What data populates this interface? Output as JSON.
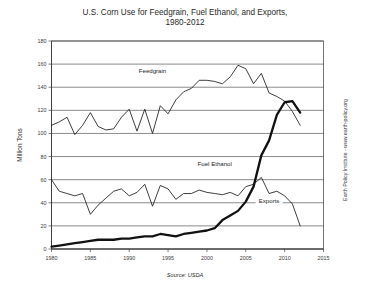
{
  "chart_data": {
    "type": "line",
    "title": "U.S. Corn Use for Feedgrain, Fuel Ethanol, and Exports, 1980-2012",
    "title_line1": "U.S. Corn Use for Feedgrain, Fuel Ethanol, and Exports,",
    "title_line2": "1980-2012",
    "xlabel": "",
    "ylabel": "Million Tons",
    "source": "Source: USDA",
    "credit": "Earth Policy Institute - www.earth-policy.org",
    "grid": true,
    "legend": "inline-labels",
    "xlim": [
      1980,
      2015
    ],
    "ylim": [
      0,
      180
    ],
    "xticks": [
      1980,
      1985,
      1990,
      1995,
      2000,
      2005,
      2010,
      2015
    ],
    "yticks": [
      0,
      20,
      40,
      60,
      80,
      100,
      120,
      140,
      160,
      180
    ],
    "x": [
      1980,
      1981,
      1982,
      1983,
      1984,
      1985,
      1986,
      1987,
      1988,
      1989,
      1990,
      1991,
      1992,
      1993,
      1994,
      1995,
      1996,
      1997,
      1998,
      1999,
      2000,
      2001,
      2002,
      2003,
      2004,
      2005,
      2006,
      2007,
      2008,
      2009,
      2010,
      2011,
      2012
    ],
    "series": [
      {
        "name": "Feedgrain",
        "style": "thin",
        "label_x": 1993,
        "label_y": 152,
        "values": [
          107,
          110,
          114,
          99,
          107,
          118,
          106,
          103,
          104,
          114,
          121,
          102,
          121,
          100,
          124,
          117,
          129,
          136,
          139,
          146,
          146,
          145,
          143,
          149,
          159,
          156,
          143,
          152,
          135,
          132,
          128,
          119,
          107
        ]
      },
      {
        "name": "Fuel Ethanol",
        "style": "thick",
        "label_x": 2001,
        "label_y": 72,
        "values": [
          2,
          3,
          4,
          5,
          6,
          7,
          8,
          8,
          8,
          9,
          9,
          10,
          11,
          11,
          13,
          12,
          11,
          13,
          14,
          15,
          16,
          18,
          25,
          29,
          33,
          41,
          54,
          81,
          94,
          116,
          127,
          128,
          118
        ]
      },
      {
        "name": "Exports",
        "style": "thin",
        "label_x": 2008,
        "label_y": 40,
        "values": [
          60,
          50,
          48,
          46,
          48,
          30,
          38,
          44,
          50,
          52,
          46,
          49,
          56,
          37,
          55,
          52,
          43,
          48,
          48,
          51,
          49,
          48,
          47,
          49,
          46,
          54,
          56,
          62,
          48,
          50,
          46,
          39,
          20
        ]
      }
    ]
  }
}
